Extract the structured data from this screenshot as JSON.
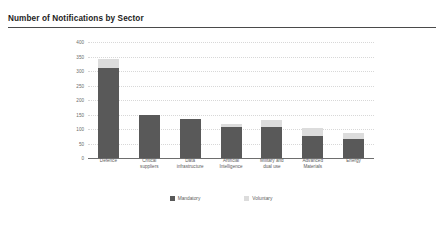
{
  "header": {
    "title": "Number of Notifications by Sector"
  },
  "legend": {
    "items": [
      {
        "label": "Mandatory",
        "color": "#595959",
        "swatch_name": "legend-swatch-mandatory"
      },
      {
        "label": "Voluntary",
        "color": "#dcdcdc",
        "swatch_name": "legend-swatch-voluntary"
      }
    ]
  },
  "chart_data": {
    "type": "bar",
    "subtype": "stacked-vertical",
    "title": "Number of Notifications by Sector",
    "xlabel": "",
    "ylabel": "",
    "ylim": [
      0,
      400
    ],
    "yticks": [
      0,
      50,
      100,
      150,
      200,
      250,
      300,
      350,
      400
    ],
    "ytick_labels": [
      "0",
      "50",
      "100",
      "150",
      "200",
      "250",
      "300",
      "350",
      "400"
    ],
    "grid": true,
    "grid_axis": "y",
    "grid_style": "dotted",
    "legend_position": "bottom-center",
    "categories": [
      "Defence",
      "Critical suppliers",
      "Data infrastructure",
      "Artificial Intelligence",
      "Military and dual use",
      "Advanced Materials",
      "Energy"
    ],
    "category_lines": [
      [
        "Defence"
      ],
      [
        "Critical",
        "suppliers"
      ],
      [
        "Data",
        "infrastructure"
      ],
      [
        "Artificial",
        "Intelligence"
      ],
      [
        "Military and",
        "dual use"
      ],
      [
        "Advanced",
        "Materials"
      ],
      [
        "Energy"
      ]
    ],
    "series": [
      {
        "name": "Mandatory",
        "color": "#595959",
        "values": [
          312,
          147,
          133,
          107,
          107,
          77,
          65
        ]
      },
      {
        "name": "Voluntary",
        "color": "#dcdcdc",
        "values": [
          28,
          2,
          2,
          11,
          23,
          25,
          23
        ]
      }
    ],
    "totals": [
      340,
      149,
      135,
      118,
      130,
      102,
      88
    ]
  },
  "style": {
    "bar_mandatory_color": "#595959",
    "bar_voluntary_color": "#dcdcdc",
    "gridline_color": "#d8d8d8",
    "axis_color": "#6e6e6e",
    "text_color": "#5c5c5c",
    "title_color": "#1d1d1d",
    "background": "#ffffff"
  }
}
